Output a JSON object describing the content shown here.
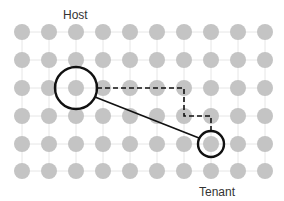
{
  "labels": {
    "host": "Host",
    "tenant": "Tenant"
  },
  "grid": {
    "cols": [
      22,
      49,
      76,
      103,
      130,
      157,
      184,
      211,
      238,
      265
    ],
    "rows": [
      32,
      60,
      88,
      116,
      144,
      171
    ],
    "node_radius": 8,
    "node_color": "#c4c4c4",
    "line_color": "#e6e6e6"
  },
  "host_node": {
    "col": 2,
    "row": 2,
    "ring_radius": 21
  },
  "tenant_node": {
    "col": 7,
    "row": 4,
    "ring_radius": 13
  },
  "dashed_path": [
    [
      97,
      88
    ],
    [
      184,
      88
    ],
    [
      184,
      116
    ],
    [
      211,
      116
    ],
    [
      211,
      131
    ]
  ],
  "solid_link": {
    "from": [
      95,
      97
    ],
    "to": [
      199,
      138
    ]
  },
  "colors": {
    "stroke": "#111111"
  }
}
